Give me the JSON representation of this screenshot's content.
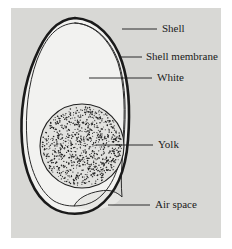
{
  "figure": {
    "background_color": "#ffffff",
    "panel_color": "#d8d8d5",
    "ink_color": "#1a1a1a",
    "egg_fill_color": "#f2f2f0",
    "yolk_fill_color": "#e2e2df",
    "panel": {
      "x": 11,
      "y": 8,
      "width": 210,
      "height": 230
    }
  },
  "labels": [
    {
      "id": "shell",
      "text": "Shell",
      "text_x": 162,
      "text_y": 29,
      "leader": {
        "x1": 122,
        "y1": 29,
        "x2": 157,
        "y2": 29
      }
    },
    {
      "id": "shell-membrane",
      "text": "Shell membrane",
      "text_x": 146,
      "text_y": 57,
      "leader": {
        "x1": 120,
        "y1": 57,
        "x2": 142,
        "y2": 57
      }
    },
    {
      "id": "white",
      "text": "White",
      "text_x": 157,
      "text_y": 78,
      "leader": {
        "x1": 89,
        "y1": 78,
        "x2": 152,
        "y2": 78
      }
    },
    {
      "id": "yolk",
      "text": "Yolk",
      "text_x": 158,
      "text_y": 145,
      "leader": {
        "x1": 96,
        "y1": 145,
        "x2": 153,
        "y2": 145
      }
    },
    {
      "id": "air-space",
      "text": "Air space",
      "text_x": 155,
      "text_y": 205,
      "leader": {
        "x1": 108,
        "y1": 205,
        "x2": 150,
        "y2": 205
      }
    }
  ],
  "anatomy": {
    "shell": {
      "name": "Shell",
      "stroke_width": 2.6,
      "path": "M 75 18 C 97 19 114 38 122 62 C 130 86 130 114 128 140 C 126 168 117 193 98 207 C 85 216 65 216 51 207 C 33 195 24 170 22 142 C 20 114 24 84 35 58 C 45 34 57 19 75 18 Z"
    },
    "shell_membrane": {
      "name": "Shell membrane",
      "stroke_width": 1.0,
      "path": "M 75 23 C 95 24 110 41 118 63 C 125 86 125 113 123 139 C 121 165 113 188 96 200 C 90 204 82 206 74 206 C 78 198 88 193 100 191 C 110 189 117 192 122 197 C 120 173 123 155 124 139 C 126 113 126 86 119 63 C 111 41 96 24 75 23 Z"
    },
    "membrane_inner_arc": {
      "name": "Shell membrane inner arc",
      "stroke_width": 1.0,
      "path": "M 75 23 C 57 24 46 37 37 60 C 28 85 25 114 27 141 C 29 167 38 190 54 201 C 61 205 68 206 74 206"
    },
    "air_space": {
      "name": "Air space",
      "stroke_width": 1.0,
      "path": "M 74 206 C 78 198 88 193 100 191 C 110 189 117 192 122 197 C 118 203 110 208 98 209 C 88 210 79 209 74 206 Z"
    },
    "yolk": {
      "name": "Yolk",
      "cx": 82,
      "cy": 146,
      "r": 42,
      "stroke_width": 1.1,
      "stipple_count": 900,
      "stipple_radius": 0.62
    }
  }
}
